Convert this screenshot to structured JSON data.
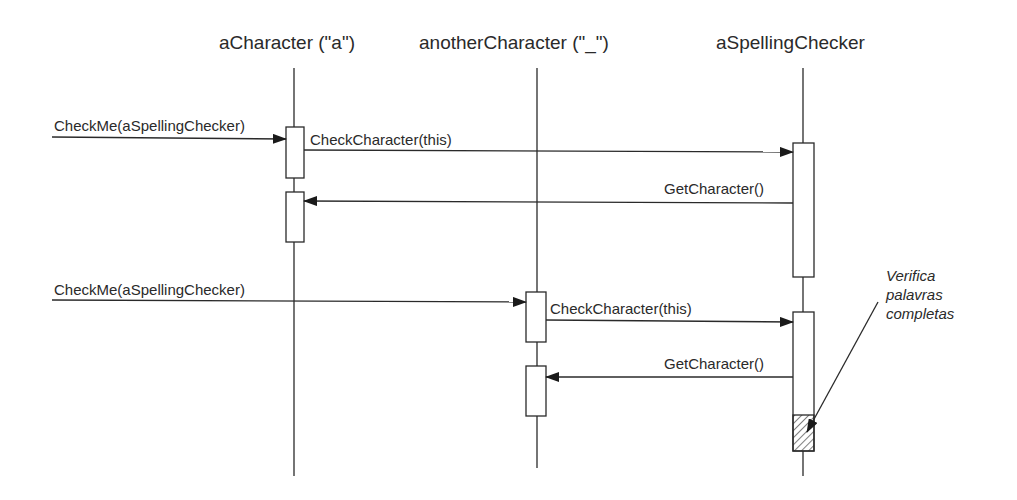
{
  "diagram": {
    "type": "UML sequence diagram",
    "objects": [
      {
        "name": "aCharacter (\"a\")",
        "x": 294
      },
      {
        "name": "anotherCharacter (\"_\")",
        "x": 537
      },
      {
        "name": "aSpellingChecker",
        "x": 803
      }
    ],
    "messages": [
      {
        "label": "CheckMe(aSpellingChecker)",
        "from": "external",
        "to": "aCharacter (\"a\")"
      },
      {
        "label": "CheckCharacter(this)",
        "from": "aCharacter (\"a\")",
        "to": "aSpellingChecker"
      },
      {
        "label": "GetCharacter()",
        "from": "aSpellingChecker",
        "to": "aCharacter (\"a\")"
      },
      {
        "label": "CheckMe(aSpellingChecker)",
        "from": "external",
        "to": "anotherCharacter (\"_\")"
      },
      {
        "label": "CheckCharacter(this)",
        "from": "anotherCharacter (\"_\")",
        "to": "aSpellingChecker"
      },
      {
        "label": "GetCharacter()",
        "from": "aSpellingChecker",
        "to": "anotherCharacter (\"_\")"
      }
    ],
    "note": {
      "lines": [
        "Verifica",
        "palavras",
        "completas"
      ],
      "points_to": "hatched activation segment on aSpellingChecker"
    },
    "colors": {
      "line": "#2a2a2a",
      "background": "#ffffff"
    }
  }
}
